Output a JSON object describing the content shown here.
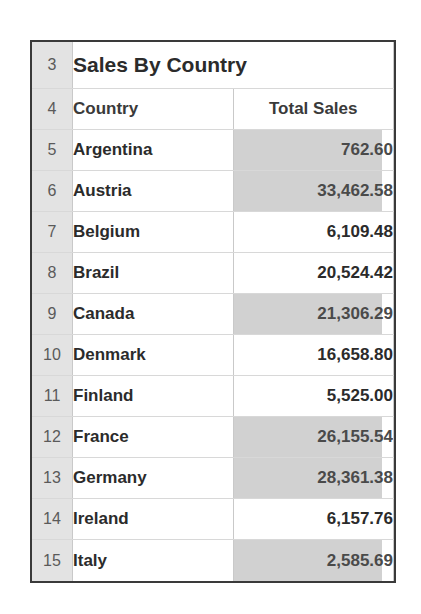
{
  "sheet": {
    "title": "Sales By Country",
    "title_row_number": "3",
    "header_row_number": "4",
    "columns": [
      "Country",
      "Total Sales"
    ],
    "accent_shade_color": "#d1d1d1",
    "gutter_color": "#e3e3e3",
    "border_color": "#3a3a3a",
    "rows": [
      {
        "row_number": "5",
        "country": "Argentina",
        "total_sales": "762.60",
        "shaded": true
      },
      {
        "row_number": "6",
        "country": "Austria",
        "total_sales": "33,462.58",
        "shaded": true
      },
      {
        "row_number": "7",
        "country": "Belgium",
        "total_sales": "6,109.48",
        "shaded": false
      },
      {
        "row_number": "8",
        "country": "Brazil",
        "total_sales": "20,524.42",
        "shaded": false
      },
      {
        "row_number": "9",
        "country": "Canada",
        "total_sales": "21,306.29",
        "shaded": true
      },
      {
        "row_number": "10",
        "country": "Denmark",
        "total_sales": "16,658.80",
        "shaded": false
      },
      {
        "row_number": "11",
        "country": "Finland",
        "total_sales": "5,525.00",
        "shaded": false
      },
      {
        "row_number": "12",
        "country": "France",
        "total_sales": "26,155.54",
        "shaded": true
      },
      {
        "row_number": "13",
        "country": "Germany",
        "total_sales": "28,361.38",
        "shaded": true
      },
      {
        "row_number": "14",
        "country": "Ireland",
        "total_sales": "6,157.76",
        "shaded": false
      },
      {
        "row_number": "15",
        "country": "Italy",
        "total_sales": "2,585.69",
        "shaded": true
      }
    ]
  },
  "chart_data": {
    "type": "table",
    "title": "Sales By Country",
    "columns": [
      "Country",
      "Total Sales"
    ],
    "categories": [
      "Argentina",
      "Austria",
      "Belgium",
      "Brazil",
      "Canada",
      "Denmark",
      "Finland",
      "France",
      "Germany",
      "Ireland",
      "Italy"
    ],
    "values": [
      762.6,
      33462.58,
      6109.48,
      20524.42,
      21306.29,
      16658.8,
      5525.0,
      26155.54,
      28361.38,
      6157.76,
      2585.69
    ],
    "xlabel": "Country",
    "ylabel": "Total Sales"
  }
}
